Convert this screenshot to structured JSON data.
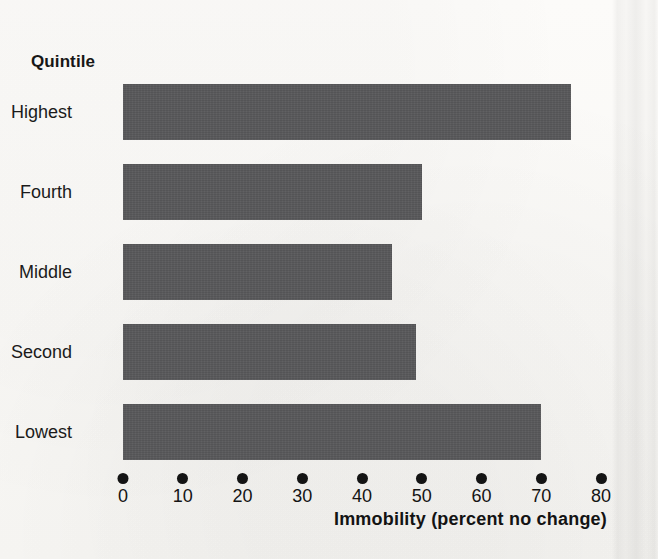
{
  "chart_data": {
    "type": "bar",
    "orientation": "horizontal",
    "title": "",
    "xlabel": "Immobility (percent no change)",
    "ylabel": "Quintile",
    "categories": [
      "Highest",
      "Fourth",
      "Middle",
      "Second",
      "Lowest"
    ],
    "values": [
      75,
      50,
      45,
      49,
      70
    ],
    "xlim": [
      0,
      80
    ],
    "xticks": [
      0,
      10,
      20,
      30,
      40,
      50,
      60,
      70,
      80
    ],
    "xtick_labels": [
      "0",
      "10",
      "20",
      "30",
      "40",
      "50",
      "60",
      "70",
      "80"
    ],
    "grid": false,
    "legend": null,
    "tick_marker_style": "filled-circle",
    "bar_color": "#58585a",
    "background_color": "#fbfaf8",
    "text_color": "#141414"
  },
  "axis": {
    "y_header": "Quintile",
    "x_title": "Immobility (percent no change)"
  }
}
